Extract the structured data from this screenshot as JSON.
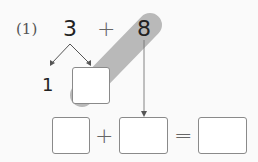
{
  "problem": {
    "label": "(1)",
    "operand_a": "3",
    "operator": "+",
    "operand_b": "8",
    "split_part": "1",
    "split_blank": "",
    "equation": {
      "blank_1": "",
      "plus": "+",
      "blank_2": "",
      "equals": "=",
      "result": ""
    }
  },
  "colors": {
    "highlight_band": "#b9b9b9",
    "arrow": "#555555",
    "box_border": "#8a8a8a"
  }
}
